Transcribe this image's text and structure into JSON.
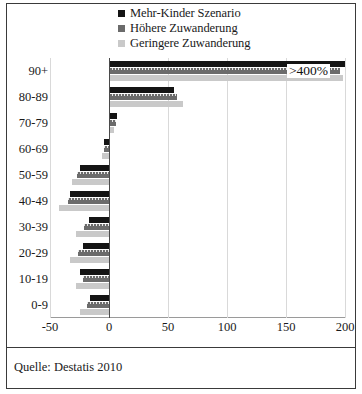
{
  "figure": {
    "caption": "Quelle: Destatis 2010"
  },
  "legend": {
    "position": "top-center",
    "items": [
      {
        "label": "Mehr-Kinder Szenario",
        "color": "#141414"
      },
      {
        "label": "Höhere Zuwanderung",
        "color": "#6b6b6b"
      },
      {
        "label": "Geringere Zuwanderung",
        "color": "#c9c9c9"
      }
    ]
  },
  "annotations": [
    {
      "text": ">400%",
      "category": "90+",
      "series": "Mehr-Kinder Szenario"
    }
  ],
  "chart_data": {
    "type": "bar",
    "orientation": "horizontal",
    "title": "",
    "xlabel": "",
    "ylabel": "",
    "xlim": [
      -50,
      200
    ],
    "xticks": [
      -50,
      0,
      50,
      100,
      150,
      200
    ],
    "xticklabels": [
      "-50",
      "0",
      "50",
      "100",
      "150",
      "200"
    ],
    "grid": true,
    "grid_axis": "x",
    "categories": [
      "90+",
      "80-89",
      "70-79",
      "60-69",
      "50-59",
      "40-49",
      "30-39",
      "20-29",
      "10-19",
      "0-9"
    ],
    "series": [
      {
        "name": "Mehr-Kinder Szenario",
        "color": "#141414",
        "values": [
          200,
          55,
          7,
          -4,
          -25,
          -33,
          -17,
          -22,
          -25,
          -16
        ]
      },
      {
        "name": "Höhere Zuwanderung",
        "color": "#6b6b6b",
        "values": [
          196,
          58,
          6,
          -4,
          -27,
          -35,
          -21,
          -26,
          -22,
          -19
        ]
      },
      {
        "name": "Geringere Zuwanderung",
        "color": "#c9c9c9",
        "values": [
          198,
          63,
          4,
          -6,
          -31,
          -42,
          -28,
          -33,
          -28,
          -25
        ]
      }
    ]
  }
}
